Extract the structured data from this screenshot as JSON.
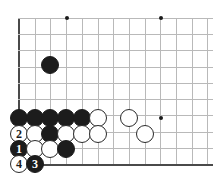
{
  "diagram": {
    "kind": "go-board-diagram",
    "board_region": "bottom-left corner",
    "grid": {
      "origin_x": 19,
      "origin_y": 18,
      "spacing": 15.7,
      "columns": 13,
      "rows": 10,
      "left_edge": true,
      "bottom_edge": true,
      "line_color": "#b9b9b9",
      "edge_color": "#4a4a4a"
    },
    "star_points": [
      {
        "x": 67,
        "y": 18
      },
      {
        "x": 161,
        "y": 18
      },
      {
        "x": 161,
        "y": 118
      }
    ],
    "stones": [
      {
        "color": "black",
        "x": 50,
        "y": 65,
        "label": ""
      },
      {
        "color": "black",
        "x": 19,
        "y": 118,
        "label": ""
      },
      {
        "color": "black",
        "x": 35,
        "y": 118,
        "label": ""
      },
      {
        "color": "black",
        "x": 50,
        "y": 118,
        "label": ""
      },
      {
        "color": "black",
        "x": 66,
        "y": 118,
        "label": ""
      },
      {
        "color": "black",
        "x": 82,
        "y": 118,
        "label": ""
      },
      {
        "color": "white",
        "x": 98,
        "y": 118,
        "label": ""
      },
      {
        "color": "white",
        "x": 129,
        "y": 118,
        "label": ""
      },
      {
        "color": "white",
        "x": 19,
        "y": 134,
        "label": "2"
      },
      {
        "color": "white",
        "x": 35,
        "y": 134,
        "label": ""
      },
      {
        "color": "black",
        "x": 50,
        "y": 134,
        "label": ""
      },
      {
        "color": "white",
        "x": 66,
        "y": 134,
        "label": ""
      },
      {
        "color": "white",
        "x": 82,
        "y": 134,
        "label": ""
      },
      {
        "color": "white",
        "x": 98,
        "y": 134,
        "label": ""
      },
      {
        "color": "white",
        "x": 145,
        "y": 134,
        "label": ""
      },
      {
        "color": "black",
        "x": 19,
        "y": 149,
        "label": "1"
      },
      {
        "color": "white",
        "x": 35,
        "y": 149,
        "label": ""
      },
      {
        "color": "white",
        "x": 50,
        "y": 149,
        "label": ""
      },
      {
        "color": "black",
        "x": 66,
        "y": 149,
        "label": ""
      },
      {
        "color": "white",
        "x": 19,
        "y": 164,
        "label": "4"
      },
      {
        "color": "black",
        "x": 35,
        "y": 164,
        "label": "3"
      }
    ],
    "move_sequence": [
      {
        "number": "1",
        "color": "black"
      },
      {
        "number": "2",
        "color": "white"
      },
      {
        "number": "3",
        "color": "black"
      },
      {
        "number": "4",
        "color": "white"
      }
    ]
  }
}
